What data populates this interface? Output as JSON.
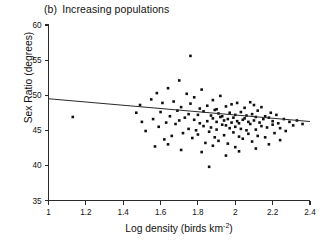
{
  "figure": {
    "panel_tag": "(b)",
    "panel_title": "Increasing populations"
  },
  "axes": {
    "y_label": "Sex Ratio (degrees)",
    "x_label_main": "Log density (birds km",
    "x_label_sup": "-2",
    "x_label_close": ")",
    "y_ticks": [
      "35",
      "40",
      "45",
      "50",
      "55",
      "60"
    ],
    "x_ticks": [
      "1",
      "1.2",
      "1.4",
      "1.6",
      "1.8",
      "2",
      "2.2",
      "2.4"
    ]
  },
  "chart_data": {
    "type": "scatter",
    "xlabel": "Log density (birds km^-2)",
    "ylabel": "Sex Ratio (degrees)",
    "xlim": [
      1,
      2.4
    ],
    "ylim": [
      35,
      60
    ],
    "xticks": [
      1,
      1.2,
      1.4,
      1.6,
      1.8,
      2,
      2.2,
      2.4
    ],
    "yticks": [
      35,
      40,
      45,
      50,
      55,
      60
    ],
    "grid": false,
    "legend": "none",
    "marker": "square",
    "marker_color": "#101010",
    "marker_size_px": 2.6,
    "trendline": {
      "type": "linear-fit",
      "x_start": 1.0,
      "y_start": 49.5,
      "x_end": 2.4,
      "y_end": 46.25,
      "color": "#2b2b2b"
    },
    "points": [
      [
        1.13,
        46.9
      ],
      [
        1.47,
        47.5
      ],
      [
        1.49,
        48.6
      ],
      [
        1.5,
        46.2
      ],
      [
        1.52,
        44.9
      ],
      [
        1.55,
        49.4
      ],
      [
        1.56,
        46.6
      ],
      [
        1.58,
        50.3
      ],
      [
        1.59,
        45.5
      ],
      [
        1.6,
        47.6
      ],
      [
        1.61,
        48.9
      ],
      [
        1.62,
        43.7
      ],
      [
        1.63,
        46.1
      ],
      [
        1.64,
        51.0
      ],
      [
        1.65,
        47.0
      ],
      [
        1.66,
        44.2
      ],
      [
        1.67,
        49.1
      ],
      [
        1.68,
        45.9
      ],
      [
        1.69,
        47.8
      ],
      [
        1.7,
        52.1
      ],
      [
        1.7,
        46.4
      ],
      [
        1.71,
        48.3
      ],
      [
        1.72,
        44.6
      ],
      [
        1.73,
        46.8
      ],
      [
        1.74,
        50.2
      ],
      [
        1.75,
        45.2
      ],
      [
        1.75,
        47.3
      ],
      [
        1.76,
        55.6
      ],
      [
        1.76,
        48.8
      ],
      [
        1.77,
        43.9
      ],
      [
        1.78,
        46.5
      ],
      [
        1.78,
        49.7
      ],
      [
        1.79,
        45.0
      ],
      [
        1.8,
        47.2
      ],
      [
        1.8,
        44.4
      ],
      [
        1.81,
        48.1
      ],
      [
        1.81,
        46.0
      ],
      [
        1.82,
        50.8
      ],
      [
        1.83,
        45.6
      ],
      [
        1.83,
        47.7
      ],
      [
        1.84,
        43.2
      ],
      [
        1.85,
        46.3
      ],
      [
        1.85,
        48.5
      ],
      [
        1.86,
        44.8
      ],
      [
        1.86,
        39.8
      ],
      [
        1.87,
        47.1
      ],
      [
        1.87,
        45.4
      ],
      [
        1.88,
        49.3
      ],
      [
        1.88,
        46.7
      ],
      [
        1.89,
        44.0
      ],
      [
        1.89,
        47.9
      ],
      [
        1.9,
        46.2
      ],
      [
        1.9,
        48.0
      ],
      [
        1.9,
        45.1
      ],
      [
        1.91,
        47.4
      ],
      [
        1.91,
        43.5
      ],
      [
        1.92,
        46.9
      ],
      [
        1.92,
        49.9
      ],
      [
        1.93,
        45.8
      ],
      [
        1.93,
        47.0
      ],
      [
        1.94,
        44.3
      ],
      [
        1.94,
        46.4
      ],
      [
        1.95,
        48.4
      ],
      [
        1.95,
        45.7
      ],
      [
        1.96,
        46.6
      ],
      [
        1.96,
        43.1
      ],
      [
        1.97,
        47.5
      ],
      [
        1.97,
        45.3
      ],
      [
        1.98,
        46.1
      ],
      [
        1.98,
        48.7
      ],
      [
        1.99,
        44.7
      ],
      [
        1.99,
        46.8
      ],
      [
        2.0,
        45.5
      ],
      [
        2.0,
        47.2
      ],
      [
        2.0,
        42.6
      ],
      [
        2.01,
        46.3
      ],
      [
        2.01,
        48.9
      ],
      [
        2.02,
        44.1
      ],
      [
        2.02,
        46.0
      ],
      [
        2.03,
        47.6
      ],
      [
        2.03,
        45.2
      ],
      [
        2.04,
        46.5
      ],
      [
        2.04,
        43.8
      ],
      [
        2.05,
        48.2
      ],
      [
        2.05,
        46.7
      ],
      [
        2.06,
        45.0
      ],
      [
        2.06,
        47.1
      ],
      [
        2.07,
        44.5
      ],
      [
        2.07,
        46.2
      ],
      [
        2.08,
        49.0
      ],
      [
        2.08,
        45.9
      ],
      [
        2.09,
        47.3
      ],
      [
        2.09,
        43.4
      ],
      [
        2.1,
        46.4
      ],
      [
        2.1,
        48.6
      ],
      [
        2.11,
        45.1
      ],
      [
        2.11,
        46.9
      ],
      [
        2.12,
        44.2
      ],
      [
        2.12,
        47.8
      ],
      [
        2.13,
        46.1
      ],
      [
        2.14,
        45.6
      ],
      [
        2.14,
        48.3
      ],
      [
        2.15,
        46.6
      ],
      [
        2.16,
        44.0
      ],
      [
        2.16,
        47.0
      ],
      [
        2.17,
        45.4
      ],
      [
        2.18,
        46.8
      ],
      [
        2.18,
        43.0
      ],
      [
        2.19,
        47.5
      ],
      [
        2.2,
        45.8
      ],
      [
        2.2,
        46.3
      ],
      [
        2.21,
        44.6
      ],
      [
        2.22,
        47.2
      ],
      [
        2.23,
        46.0
      ],
      [
        2.24,
        45.3
      ],
      [
        2.26,
        46.6
      ],
      [
        2.27,
        44.9
      ],
      [
        2.29,
        46.2
      ],
      [
        2.31,
        45.7
      ],
      [
        2.33,
        46.4
      ],
      [
        2.36,
        45.9
      ],
      [
        1.64,
        43.0
      ],
      [
        1.71,
        42.2
      ],
      [
        1.82,
        41.9
      ],
      [
        1.95,
        41.4
      ],
      [
        2.02,
        42.0
      ],
      [
        1.88,
        42.8
      ],
      [
        2.11,
        42.4
      ],
      [
        1.57,
        42.7
      ],
      [
        2.24,
        43.6
      ]
    ]
  }
}
